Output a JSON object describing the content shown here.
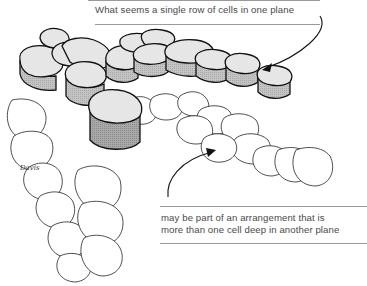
{
  "figure": {
    "top_caption": "What seems a single row of cells in one plane",
    "bottom_caption_line1": "may be part of an arrangement that is",
    "bottom_caption_line2": "more than one cell deep in another plane",
    "signature": "Davis",
    "colors": {
      "outline": "#1a1a1a",
      "cell_top": "#e6e6e6",
      "cell_side": "#b8b8b8",
      "cell_side_dark": "#9d9d9d",
      "lower_cell": "#ffffff",
      "caption_text": "#4a4a4a",
      "rule": "#9a9a9a"
    }
  }
}
